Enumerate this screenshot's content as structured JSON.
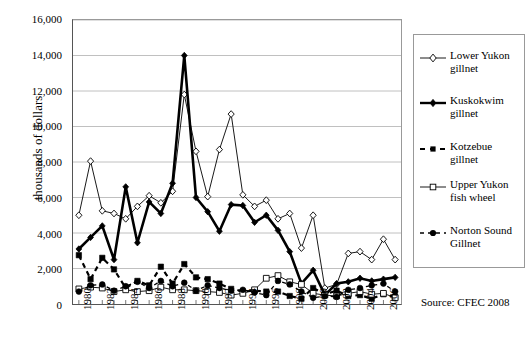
{
  "chart_data": {
    "type": "line",
    "title": "",
    "xlabel": "",
    "ylabel": "thousands of dollars",
    "ylim": [
      0,
      16000
    ],
    "ytick_values": [
      0,
      2000,
      4000,
      6000,
      8000,
      10000,
      12000,
      14000,
      16000
    ],
    "ytick_labels": [
      "0",
      "2,000",
      "4,000",
      "6,000",
      "8,000",
      "10,000",
      "12,000",
      "14,000",
      "16,000"
    ],
    "grid": true,
    "legend_position": "right",
    "x": [
      1980,
      1981,
      1982,
      1983,
      1984,
      1985,
      1986,
      1987,
      1988,
      1989,
      1990,
      1991,
      1992,
      1993,
      1994,
      1995,
      1996,
      1997,
      1998,
      1999,
      2000,
      2001,
      2002,
      2003,
      2004,
      2005,
      2006,
      2007
    ],
    "xtick_labels": [
      "1980",
      "1982",
      "1984",
      "1986",
      "1988",
      "1990",
      "1992",
      "1994",
      "1996",
      "1998",
      "2000",
      "2002",
      "2004",
      "2006"
    ],
    "xtick_values": [
      1980,
      1982,
      1984,
      1986,
      1988,
      1990,
      1992,
      1994,
      1996,
      1998,
      2000,
      2002,
      2004,
      2006
    ],
    "series": [
      {
        "name": "Lower Yukon gillnet",
        "marker": "open-diamond",
        "line": "thin-solid",
        "values": [
          5000,
          8050,
          5250,
          5100,
          4800,
          5500,
          6100,
          5700,
          6350,
          11800,
          8600,
          6050,
          8700,
          10700,
          6150,
          5500,
          5850,
          4800,
          5100,
          3150,
          5000,
          900,
          1100,
          2850,
          2950,
          2500,
          3650,
          2500
        ]
      },
      {
        "name": "Kuskokwim gillnet",
        "marker": "filled-diamond",
        "line": "thick-solid",
        "values": [
          3100,
          3750,
          4400,
          2500,
          6600,
          3450,
          5750,
          5100,
          6800,
          14000,
          6000,
          5200,
          4100,
          5600,
          5550,
          4600,
          5000,
          4150,
          2950,
          1150,
          1900,
          500,
          1150,
          1250,
          1450,
          1300,
          1400,
          1500
        ]
      },
      {
        "name": "Kotzebue gillnet",
        "marker": "filled-square",
        "line": "dashed",
        "values": [
          2750,
          1400,
          2600,
          1950,
          900,
          1300,
          1050,
          2100,
          1150,
          2250,
          1500,
          1400,
          1150,
          850,
          700,
          750,
          700,
          700,
          450,
          300,
          900,
          550,
          750,
          450,
          500,
          300,
          550,
          400
        ]
      },
      {
        "name": "Upper Yukon fish wheel",
        "marker": "open-square",
        "line": "thin-solid",
        "values": [
          850,
          950,
          900,
          700,
          800,
          700,
          750,
          950,
          800,
          800,
          750,
          700,
          650,
          500,
          600,
          800,
          1450,
          1600,
          1250,
          1100,
          600,
          500,
          450,
          600,
          700,
          550,
          600,
          350
        ]
      },
      {
        "name": "Norton Sound Gillnet",
        "marker": "filled-circle",
        "line": "dot-dash",
        "values": [
          700,
          1050,
          1100,
          750,
          1000,
          1250,
          900,
          1300,
          1000,
          1200,
          750,
          1050,
          900,
          750,
          800,
          650,
          500,
          1300,
          1100,
          700,
          350,
          450,
          400,
          800,
          900,
          1050,
          1150,
          700
        ]
      }
    ],
    "source_note": "Source:  CFEC 2008"
  },
  "legend": {
    "items": [
      {
        "label_line1": "Lower Yukon",
        "label_line2": "gillnet"
      },
      {
        "label_line1": "Kuskokwim",
        "label_line2": "gillnet"
      },
      {
        "label_line1": "Kotzebue gillnet",
        "label_line2": ""
      },
      {
        "label_line1": "Upper Yukon",
        "label_line2": "fish wheel"
      },
      {
        "label_line1": "Norton Sound",
        "label_line2": "Gillnet"
      }
    ]
  },
  "colors": {
    "line": "#000000",
    "grid": "#b0b0b0",
    "axis": "#555555",
    "background": "#ffffff"
  }
}
